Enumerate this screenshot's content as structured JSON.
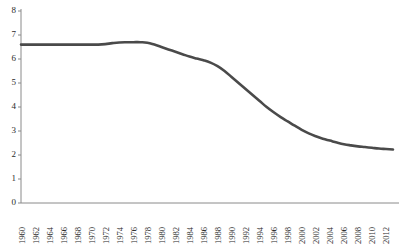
{
  "chart_data": {
    "type": "line",
    "title": "",
    "subtitle": "",
    "xlabel": "",
    "ylabel": "",
    "grid": false,
    "legend": false,
    "legend_position": "none",
    "line_color": "#4a4a4a",
    "axis_color": "#8a8a8a",
    "background": "#ffffff",
    "xlim": [
      1960,
      2013
    ],
    "ylim": [
      0,
      8
    ],
    "ytick_labels": [
      "0",
      "1",
      "2",
      "3",
      "4",
      "5",
      "6",
      "7",
      "8"
    ],
    "ytick_values": [
      0,
      1,
      2,
      3,
      4,
      5,
      6,
      7,
      8
    ],
    "xtick_labels": [
      "1960",
      "1962",
      "1964",
      "1966",
      "1968",
      "1970",
      "1972",
      "1974",
      "1976",
      "1978",
      "1980",
      "1982",
      "1984",
      "1986",
      "1988",
      "1990",
      "1992",
      "1994",
      "1996",
      "1998",
      "2000",
      "2002",
      "2004",
      "2006",
      "2008",
      "2010",
      "2012"
    ],
    "xtick_values": [
      1960,
      1962,
      1964,
      1966,
      1968,
      1970,
      1972,
      1974,
      1976,
      1978,
      1980,
      1982,
      1984,
      1986,
      1988,
      1990,
      1992,
      1994,
      1996,
      1998,
      2000,
      2002,
      2004,
      2006,
      2008,
      2010,
      2012
    ],
    "x": [
      1960,
      1961,
      1962,
      1963,
      1964,
      1965,
      1966,
      1967,
      1968,
      1969,
      1970,
      1971,
      1972,
      1973,
      1974,
      1975,
      1976,
      1977,
      1978,
      1979,
      1980,
      1981,
      1982,
      1983,
      1984,
      1985,
      1986,
      1987,
      1988,
      1989,
      1990,
      1991,
      1992,
      1993,
      1994,
      1995,
      1996,
      1997,
      1998,
      1999,
      2000,
      2001,
      2002,
      2003,
      2004,
      2005,
      2006,
      2007,
      2008,
      2009,
      2010,
      2011,
      2012,
      2013
    ],
    "values": [
      6.6,
      6.6,
      6.6,
      6.6,
      6.6,
      6.6,
      6.6,
      6.6,
      6.6,
      6.6,
      6.6,
      6.6,
      6.62,
      6.66,
      6.69,
      6.7,
      6.7,
      6.7,
      6.68,
      6.6,
      6.5,
      6.4,
      6.3,
      6.2,
      6.1,
      6.02,
      5.95,
      5.85,
      5.7,
      5.5,
      5.25,
      5.0,
      4.75,
      4.5,
      4.25,
      4.0,
      3.78,
      3.58,
      3.4,
      3.22,
      3.05,
      2.9,
      2.78,
      2.68,
      2.6,
      2.52,
      2.45,
      2.4,
      2.36,
      2.33,
      2.3,
      2.27,
      2.25,
      2.23
    ]
  }
}
